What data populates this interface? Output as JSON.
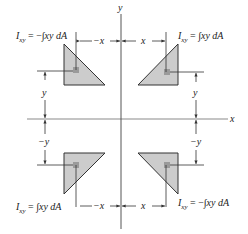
{
  "diagram": {
    "title": "",
    "axes": {
      "x_label": "x",
      "y_label": "y"
    },
    "quadrants": [
      {
        "position": "top-left",
        "product_label": "I",
        "subscript": "xy",
        "equals": " = ",
        "sign": "−",
        "integral": "∫",
        "integrand": "xy dA",
        "x_dim_label": "−x",
        "y_dim_label": "y"
      },
      {
        "position": "top-right",
        "product_label": "I",
        "subscript": "xy",
        "equals": " = ",
        "sign": "",
        "integral": "∫",
        "integrand": "xy dA",
        "x_dim_label": "x",
        "y_dim_label": "y"
      },
      {
        "position": "bottom-left",
        "product_label": "I",
        "subscript": "xy",
        "equals": " = ",
        "sign": "",
        "integral": "∫",
        "integrand": "xy dA",
        "x_dim_label": "−x",
        "y_dim_label": "−y"
      },
      {
        "position": "bottom-right",
        "product_label": "I",
        "subscript": "xy",
        "equals": " = ",
        "sign": "−",
        "integral": "∫",
        "integrand": "xy dA",
        "x_dim_label": "x",
        "y_dim_label": "−y"
      }
    ],
    "colors": {
      "shape_fill": "#cccccc",
      "element_fill": "#9a9a9a",
      "stroke": "#333333"
    }
  }
}
